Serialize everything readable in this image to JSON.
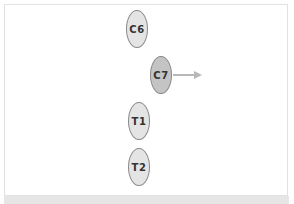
{
  "diagram": {
    "vertebrae": [
      {
        "label": "C6",
        "x": 126,
        "y": 10,
        "fill": "#e4e4e4"
      },
      {
        "label": "C7",
        "x": 150,
        "y": 56,
        "fill": "#c4c4c4"
      },
      {
        "label": "T1",
        "x": 128,
        "y": 102,
        "fill": "#e4e4e4"
      },
      {
        "label": "T2",
        "x": 128,
        "y": 148,
        "fill": "#e4e4e4"
      }
    ],
    "arrow": {
      "from_label": "C7",
      "direction": "right",
      "color": "#b8b8b8"
    }
  }
}
